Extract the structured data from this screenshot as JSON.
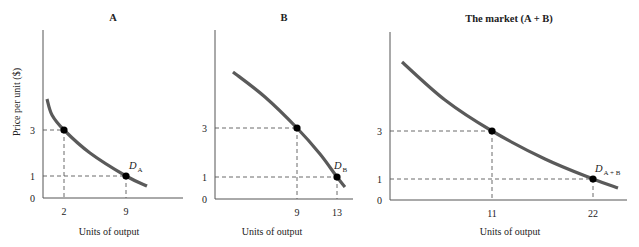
{
  "chart_data": [
    {
      "type": "line",
      "panel": "A",
      "title": "A",
      "xlabel": "Units of output",
      "ylabel": "Price per unit ($)",
      "curve_label": "D",
      "curve_label_sub": "A",
      "x_ticks": [
        2,
        9
      ],
      "y_ticks": [
        0,
        1,
        3
      ],
      "points": [
        {
          "x": 2,
          "y": 3
        },
        {
          "x": 9,
          "y": 1
        }
      ],
      "curve_px": [
        [
          47,
          99
        ],
        [
          52,
          115
        ],
        [
          64,
          130
        ],
        [
          90,
          153
        ],
        [
          126,
          176
        ],
        [
          147,
          186
        ]
      ],
      "axis_px": {
        "x0": 43,
        "ytop": 30,
        "y0": 198,
        "xend": 183
      },
      "tick_px": {
        "x": {
          "2": 64,
          "9": 126
        },
        "y": {
          "0": 198,
          "1": 176,
          "3": 130
        }
      },
      "label_px": {
        "title": [
          113,
          21
        ],
        "xlabel": [
          109,
          235
        ],
        "curve_label": [
          129,
          169
        ]
      }
    },
    {
      "type": "line",
      "panel": "B",
      "title": "B",
      "xlabel": "Units of output",
      "ylabel": "",
      "curve_label": "D",
      "curve_label_sub": "B",
      "x_ticks": [
        9,
        13
      ],
      "y_ticks": [
        0,
        1,
        3
      ],
      "points": [
        {
          "x": 9,
          "y": 3
        },
        {
          "x": 13,
          "y": 1
        }
      ],
      "curve_px": [
        [
          233,
          72
        ],
        [
          265,
          97
        ],
        [
          297,
          128
        ],
        [
          320,
          154
        ],
        [
          337,
          177
        ],
        [
          345,
          187
        ]
      ],
      "axis_px": {
        "x0": 215,
        "ytop": 30,
        "y0": 199,
        "xend": 353
      },
      "tick_px": {
        "x": {
          "9": 297,
          "13": 337
        },
        "y": {
          "0": 199,
          "1": 177,
          "3": 128
        }
      },
      "label_px": {
        "title": [
          284,
          21
        ],
        "xlabel": [
          272,
          235
        ],
        "curve_label": [
          334,
          169
        ]
      }
    },
    {
      "type": "line",
      "panel": "market",
      "title": "The market (A + B)",
      "xlabel": "Units of output",
      "ylabel": "",
      "curve_label": "D",
      "curve_label_sub": "A + B",
      "x_ticks": [
        11,
        22
      ],
      "y_ticks": [
        0,
        1,
        3
      ],
      "points": [
        {
          "x": 11,
          "y": 3
        },
        {
          "x": 22,
          "y": 1
        }
      ],
      "curve_px": [
        [
          402,
          62
        ],
        [
          445,
          100
        ],
        [
          492,
          131
        ],
        [
          545,
          159
        ],
        [
          593,
          179
        ],
        [
          618,
          188
        ]
      ],
      "axis_px": {
        "x0": 390,
        "ytop": 32,
        "y0": 200,
        "xend": 627
      },
      "tick_px": {
        "x": {
          "11": 492,
          "22": 593
        },
        "y": {
          "0": 200,
          "1": 179,
          "3": 131
        }
      },
      "label_px": {
        "title": [
          509,
          22
        ],
        "xlabel": [
          510,
          235
        ],
        "curve_label": [
          595,
          172
        ]
      }
    }
  ],
  "colors": {
    "axis": "#555555",
    "curve": "#5a5a5a",
    "point": "#000000",
    "dash": "#444444",
    "text": "#222222"
  }
}
